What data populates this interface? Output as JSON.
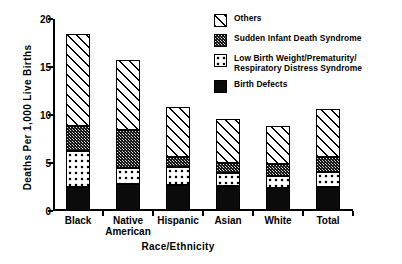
{
  "chart_data": {
    "type": "bar",
    "subtype": "stacked",
    "title": "",
    "xlabel": "Race/Ethnicity",
    "ylabel": "Deaths Per 1,000 Live Births",
    "ylim": [
      0,
      20
    ],
    "yticks": [
      0,
      5,
      10,
      15,
      20
    ],
    "ytick_labels": [
      "0",
      "5",
      "10",
      "15",
      "20"
    ],
    "grid": false,
    "legend_position": "top-right",
    "categories": [
      "Black",
      "Native American",
      "Hispanic",
      "Asian",
      "White",
      "Total"
    ],
    "category_lines": [
      [
        "Black"
      ],
      [
        "Native",
        "American"
      ],
      [
        "Hispanic"
      ],
      [
        "Asian"
      ],
      [
        "White"
      ],
      [
        "Total"
      ]
    ],
    "series": [
      {
        "name": "Birth Defects",
        "pattern": "solid-black",
        "values": [
          2.5,
          2.8,
          2.7,
          2.6,
          2.4,
          2.5
        ]
      },
      {
        "name": "Low Birth Weight/Prematurity/Respiratory Distress Syndrome",
        "pattern": "checker-dots",
        "values": [
          3.8,
          1.7,
          1.9,
          1.4,
          1.2,
          1.6
        ]
      },
      {
        "name": "Sudden Infant Death Syndrome",
        "pattern": "dark-stipple",
        "values": [
          2.6,
          3.9,
          1.0,
          1.0,
          1.3,
          1.5
        ]
      },
      {
        "name": "Others",
        "pattern": "diagonal-hatch",
        "values": [
          9.5,
          7.3,
          5.2,
          4.6,
          4.0,
          5.0
        ]
      }
    ],
    "totals": [
      18.4,
      15.7,
      10.8,
      9.6,
      8.9,
      10.6
    ]
  },
  "legend": {
    "items": [
      {
        "label": "Others",
        "pattern": "diagonal-hatch"
      },
      {
        "label": "Sudden Infant Death Syndrome",
        "pattern": "dark-stipple"
      },
      {
        "label": "Low Birth Weight/Prematurity/\nRespiratory Distress Syndrome",
        "pattern": "checker-dots"
      },
      {
        "label": "Birth Defects",
        "pattern": "solid-black"
      }
    ]
  },
  "colors": {
    "axis": "#000000",
    "text": "#000000",
    "background": "#ffffff",
    "birth_defects": "#0b0b0b",
    "sids": "#3a3a3a",
    "low_birth_weight": "#ffffff",
    "others": "#ffffff"
  }
}
